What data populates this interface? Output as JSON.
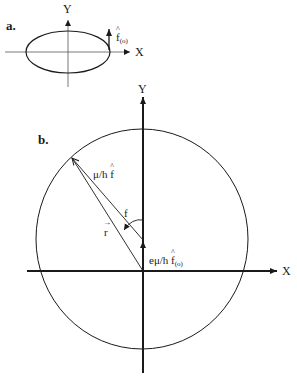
{
  "panel_a": {
    "label": "a.",
    "y_axis_label": "Y",
    "x_axis_label": "X",
    "vector_label_main": "f",
    "vector_label_sub": "(o)",
    "ellipse": {
      "cx": 68,
      "cy": 52,
      "rx": 42,
      "ry": 21
    }
  },
  "panel_b": {
    "label": "b.",
    "y_axis_label": "Y",
    "x_axis_label": "X",
    "circle": {
      "cx": 142,
      "cy": 239,
      "rx": 106,
      "ry": 110
    },
    "labels": {
      "mu_h_f_prefix": "μ/h ",
      "mu_h_f_symbol": "f",
      "angle": "f",
      "r_vector": "r",
      "e_mu_h_prefix": "eμ/h ",
      "e_mu_h_symbol": "f",
      "e_mu_h_sub": "(o)"
    }
  },
  "colors": {
    "stroke": "#1a1a1a",
    "background": "#ffffff"
  }
}
